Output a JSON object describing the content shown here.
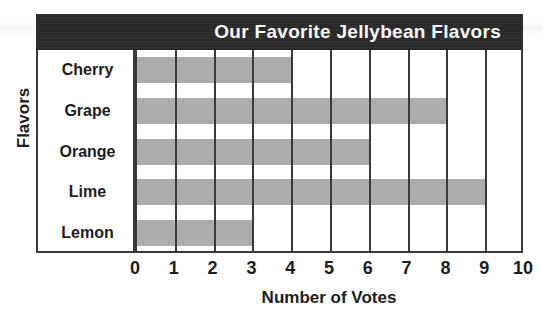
{
  "chart_data": {
    "type": "bar",
    "orientation": "horizontal",
    "title": "Our Favorite Jellybean Flavors",
    "xlabel": "Number of Votes",
    "ylabel": "Flavors",
    "categories": [
      "Cherry",
      "Grape",
      "Orange",
      "Lime",
      "Lemon"
    ],
    "values": [
      4,
      8,
      6,
      9,
      3
    ],
    "xlim": [
      0,
      10
    ],
    "xticks": [
      "0",
      "1",
      "2",
      "3",
      "4",
      "5",
      "6",
      "7",
      "8",
      "9",
      "10"
    ],
    "grid": true,
    "legend": false,
    "bar_color": "#acacac",
    "title_band_color": "#2b2b2b",
    "title_text_color": "#ffffff",
    "axis_color": "#3a3a3a",
    "background_color": "#ffffff"
  }
}
